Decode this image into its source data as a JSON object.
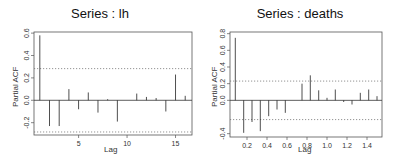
{
  "chart_data": [
    {
      "type": "bar",
      "subtype": "pacf-stem",
      "title": "Series : lh",
      "xlabel": "Lag",
      "ylabel": "Partial ACF",
      "xlim": [
        0.4,
        16.7
      ],
      "ylim": [
        -0.31,
        0.61
      ],
      "xticks": [
        5,
        10,
        15
      ],
      "yticks": [
        -0.2,
        0.0,
        0.2,
        0.4,
        0.6
      ],
      "ytick_labels": [
        "-0.2",
        "0.0",
        "0.2",
        "0.4",
        "0.6"
      ],
      "confidence_band": 0.283,
      "grid": false,
      "x": [
        1,
        2,
        3,
        4,
        5,
        6,
        7,
        8,
        9,
        10,
        11,
        12,
        13,
        14,
        15,
        16
      ],
      "values": [
        0.58,
        -0.23,
        -0.23,
        0.1,
        -0.08,
        0.07,
        -0.11,
        0.01,
        -0.19,
        0.0,
        0.06,
        0.03,
        0.02,
        -0.1,
        0.23,
        0.04
      ]
    },
    {
      "type": "bar",
      "subtype": "pacf-stem",
      "title": "Series : deaths",
      "xlabel": "Lag",
      "ylabel": "Partial ACF",
      "xlim": [
        0.03,
        1.55
      ],
      "ylim": [
        -0.44,
        0.82
      ],
      "xticks": [
        0.2,
        0.4,
        0.6,
        0.8,
        1.0,
        1.2,
        1.4
      ],
      "xtick_labels": [
        "0.2",
        "0.4",
        "0.6",
        "0.8",
        "1.0",
        "1.2",
        "1.4"
      ],
      "yticks": [
        -0.4,
        0.0,
        0.2,
        0.4,
        0.6,
        0.8
      ],
      "ytick_labels": [
        "-0.4",
        "0.0",
        "0.2",
        "0.4",
        "0.6",
        "0.8"
      ],
      "confidence_band": 0.231,
      "grid": false,
      "x": [
        0.083,
        0.167,
        0.25,
        0.333,
        0.417,
        0.5,
        0.583,
        0.667,
        0.75,
        0.833,
        0.917,
        1.0,
        1.083,
        1.167,
        1.25,
        1.333,
        1.417,
        1.5
      ],
      "values": [
        0.75,
        -0.39,
        -0.26,
        -0.37,
        -0.19,
        -0.11,
        -0.15,
        0.0,
        0.2,
        0.3,
        0.12,
        0.03,
        0.13,
        -0.02,
        -0.05,
        0.09,
        0.13,
        0.05
      ]
    }
  ],
  "panels": [
    {
      "title": "Series : lh",
      "xlabel": "Lag",
      "ylabel": "Partial ACF"
    },
    {
      "title": "Series : deaths",
      "xlabel": "Lag",
      "ylabel": "Partial ACF"
    }
  ]
}
